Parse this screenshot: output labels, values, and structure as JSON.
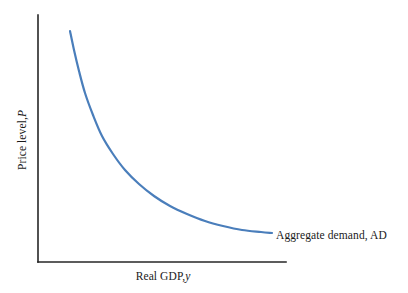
{
  "chart_data": {
    "type": "line",
    "title": "",
    "xlabel": "Real GDP, y",
    "xlabel_text": "Real GDP,",
    "xlabel_var": "y",
    "ylabel": "Price level, P",
    "ylabel_text": "Price level,",
    "ylabel_var": "P",
    "grid": false,
    "legend_position": "inline-right-of-curve",
    "axis_style": "open-L-shaped, no tick marks, no numeric tick labels",
    "xlim": [
      0,
      1
    ],
    "ylim": [
      0,
      1
    ],
    "x_ticks": [],
    "y_ticks": [],
    "series": [
      {
        "name": "Aggregate demand, AD",
        "label": "Aggregate demand, AD",
        "color": "#4a7ebb",
        "shape": "downward-sloping convex curve (rectangular-hyperbola-like)",
        "x": [
          0.129,
          0.145,
          0.165,
          0.19,
          0.221,
          0.258,
          0.302,
          0.351,
          0.407,
          0.468,
          0.532,
          0.601,
          0.673,
          0.746,
          0.823,
          0.899,
          0.944
        ],
        "y": [
          0.935,
          0.86,
          0.775,
          0.686,
          0.598,
          0.515,
          0.44,
          0.375,
          0.318,
          0.27,
          0.23,
          0.197,
          0.171,
          0.151,
          0.136,
          0.128,
          0.126
        ],
        "pixel_points": [
          [
            70,
            31
          ],
          [
            74,
            50
          ],
          [
            79,
            71
          ],
          [
            85,
            93
          ],
          [
            93,
            115
          ],
          [
            102,
            136
          ],
          [
            113,
            154
          ],
          [
            125,
            170
          ],
          [
            139,
            184
          ],
          [
            154,
            196
          ],
          [
            170,
            206
          ],
          [
            187,
            214
          ],
          [
            205,
            221
          ],
          [
            223,
            226
          ],
          [
            242,
            230
          ],
          [
            261,
            232
          ],
          [
            272,
            233
          ]
        ]
      }
    ],
    "axes_pixels": {
      "origin": [
        38,
        262
      ],
      "y_axis_top": [
        38,
        15
      ],
      "x_axis_right": [
        286,
        262
      ]
    }
  },
  "figure": {
    "background_color": "#ffffff",
    "axis_color": "#262626",
    "text_color": "#1a1a1a",
    "curve_color": "#4a7ebb"
  }
}
